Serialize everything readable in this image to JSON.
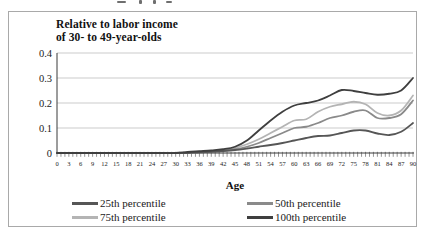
{
  "figure": {
    "title_line1": "Relative to labor income",
    "title_line2": "of 30- to 49-year-olds",
    "xlabel": "Age"
  },
  "chart_data": {
    "type": "line",
    "title": "Relative to labor income of 30- to 49-year-olds",
    "xlabel": "Age",
    "ylim": [
      0,
      0.4
    ],
    "yticks": [
      0,
      0.1,
      0.2,
      0.3,
      0.4
    ],
    "ytick_labels": [
      "0",
      "0.1",
      "0.2",
      "0.3",
      "0.4"
    ],
    "x": [
      0,
      3,
      6,
      9,
      12,
      15,
      18,
      21,
      24,
      27,
      30,
      33,
      36,
      39,
      42,
      45,
      48,
      51,
      54,
      57,
      60,
      63,
      66,
      69,
      72,
      75,
      78,
      81,
      84,
      87,
      90
    ],
    "grid": "horizontal",
    "legend_position": "bottom",
    "grid_color": "#b5b5b5",
    "axis_color": "#3a3a3a",
    "tick_label_color": "#222222",
    "series": [
      {
        "name": "25th percentile",
        "color": "#565656",
        "values": [
          0,
          0,
          0,
          0,
          0,
          0,
          0,
          0,
          0,
          0,
          0,
          0,
          0.003,
          0.005,
          0.008,
          0.012,
          0.018,
          0.025,
          0.032,
          0.04,
          0.05,
          0.06,
          0.068,
          0.07,
          0.08,
          0.09,
          0.09,
          0.078,
          0.072,
          0.085,
          0.12
        ]
      },
      {
        "name": "50th percentile",
        "color": "#8a8a8a",
        "values": [
          0,
          0,
          0,
          0,
          0,
          0,
          0,
          0,
          0,
          0,
          0,
          0,
          0.004,
          0.006,
          0.01,
          0.015,
          0.025,
          0.04,
          0.06,
          0.08,
          0.1,
          0.105,
          0.12,
          0.14,
          0.15,
          0.165,
          0.17,
          0.14,
          0.14,
          0.155,
          0.21
        ]
      },
      {
        "name": "75th percentile",
        "color": "#b4b4b4",
        "values": [
          0,
          0,
          0,
          0,
          0,
          0,
          0,
          0,
          0,
          0,
          0,
          0,
          0.005,
          0.008,
          0.012,
          0.02,
          0.035,
          0.055,
          0.08,
          0.105,
          0.13,
          0.135,
          0.165,
          0.185,
          0.195,
          0.205,
          0.195,
          0.16,
          0.15,
          0.17,
          0.23
        ]
      },
      {
        "name": "100th percentile",
        "color": "#3f3f3f",
        "values": [
          0,
          0,
          0,
          0,
          0,
          0,
          0,
          0,
          0,
          0,
          0,
          0.004,
          0.007,
          0.01,
          0.015,
          0.025,
          0.05,
          0.09,
          0.13,
          0.165,
          0.19,
          0.2,
          0.21,
          0.23,
          0.252,
          0.248,
          0.24,
          0.233,
          0.237,
          0.25,
          0.3
        ]
      }
    ]
  }
}
